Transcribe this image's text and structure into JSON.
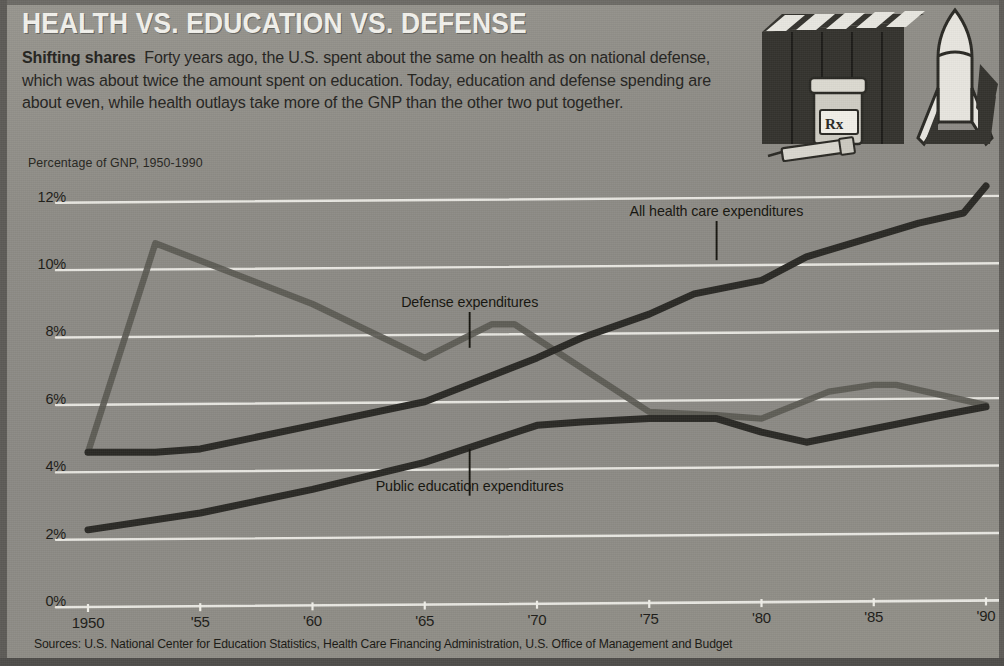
{
  "header": {
    "title": "HEALTH VS. EDUCATION VS. DEFENSE",
    "deck_lead": "Shifting shares",
    "deck_body": "Forty years ago, the U.S. spent about the same on health as on national defense, which was about twice the amount spent on education.  Today,  education and defense spending are about even, while health outlays take more of the GNP than the other two put together.",
    "caption": "Percentage of GNP, 1950-1990"
  },
  "sources": "Sources: U.S. National Center for Education Statistics, Health Care Financing Administration, U.S. Office of Management and Budget",
  "illustration": {
    "books_name": "stack-of-books",
    "pill_bottle_label": "Rx",
    "syringe_name": "syringe",
    "rocket_name": "rocket"
  },
  "colors": {
    "background": "#8d8d8a",
    "gridline": "#f0efe9",
    "title_text": "#f2f1ec",
    "body_text": "#25241f",
    "health_line": "#2b2a26",
    "education_line": "#2b2a26",
    "defense_line": "#5b5a54"
  },
  "chart_data": {
    "type": "line",
    "title": "HEALTH VS. EDUCATION VS. DEFENSE",
    "subtitle": "Percentage of GNP, 1950-1990",
    "xlabel": "",
    "ylabel": "Percentage of GNP",
    "xlim": [
      1950,
      1990
    ],
    "ylim": [
      0,
      13
    ],
    "yticks": [
      0,
      2,
      4,
      6,
      8,
      10,
      12
    ],
    "ytick_labels": [
      "0%",
      "2%",
      "4%",
      "6%",
      "8%",
      "10%",
      "12%"
    ],
    "xticks": [
      1950,
      1955,
      1960,
      1965,
      1970,
      1975,
      1980,
      1985,
      1990
    ],
    "xtick_labels": [
      "1950",
      "'55",
      "'60",
      "'65",
      "'70",
      "'75",
      "'80",
      "'85",
      "'90"
    ],
    "grid": true,
    "legend": "inline-annotations",
    "series": [
      {
        "name": "All health care expenditures",
        "annotation": "All health care expenditures",
        "color": "#2b2a26",
        "points": [
          [
            1950,
            4.5
          ],
          [
            1953,
            4.5
          ],
          [
            1955,
            4.6
          ],
          [
            1960,
            5.3
          ],
          [
            1965,
            6.0
          ],
          [
            1970,
            7.3
          ],
          [
            1972,
            7.9
          ],
          [
            1975,
            8.6
          ],
          [
            1977,
            9.2
          ],
          [
            1980,
            9.6
          ],
          [
            1982,
            10.3
          ],
          [
            1985,
            10.9
          ],
          [
            1987,
            11.3
          ],
          [
            1989,
            11.6
          ],
          [
            1990,
            12.4
          ]
        ]
      },
      {
        "name": "Defense expenditures",
        "annotation": "Defense expenditures",
        "color": "#5b5a54",
        "points": [
          [
            1950,
            4.5
          ],
          [
            1953,
            10.7
          ],
          [
            1960,
            8.9
          ],
          [
            1965,
            7.3
          ],
          [
            1968,
            8.3
          ],
          [
            1969,
            8.3
          ],
          [
            1975,
            5.7
          ],
          [
            1978,
            5.6
          ],
          [
            1980,
            5.5
          ],
          [
            1983,
            6.3
          ],
          [
            1985,
            6.5
          ],
          [
            1986,
            6.5
          ],
          [
            1990,
            5.9
          ]
        ]
      },
      {
        "name": "Public education expenditures",
        "annotation": "Public education expenditures",
        "color": "#2b2a26",
        "points": [
          [
            1950,
            2.2
          ],
          [
            1955,
            2.7
          ],
          [
            1960,
            3.4
          ],
          [
            1965,
            4.2
          ],
          [
            1970,
            5.3
          ],
          [
            1972,
            5.4
          ],
          [
            1975,
            5.5
          ],
          [
            1978,
            5.5
          ],
          [
            1980,
            5.1
          ],
          [
            1982,
            4.8
          ],
          [
            1985,
            5.2
          ],
          [
            1988,
            5.6
          ],
          [
            1990,
            5.85
          ]
        ]
      }
    ],
    "annotations": [
      {
        "text": "All health care expenditures",
        "x": 1978,
        "y": 11.6,
        "leader_to_y": 10.2
      },
      {
        "text": "Defense expenditures",
        "x": 1967,
        "y": 8.9,
        "leader_to_y": 7.6
      },
      {
        "text": "Public education expenditures",
        "x": 1967,
        "y": 3.45,
        "leader_to_y": 4.6
      }
    ]
  }
}
